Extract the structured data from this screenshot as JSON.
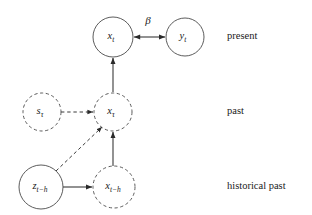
{
  "figure": {
    "type": "causal-graph-diagram",
    "background_color": "#ffffff",
    "line_color": "#3a3a3a",
    "node_stroke_color": "#4a4a4a",
    "text_color": "#1a1a1a"
  },
  "nodes": [
    {
      "id": "x_t",
      "label": "x",
      "subscript": "t",
      "style": "solid",
      "cx": 113,
      "cy": 37,
      "r": 20,
      "row": "present"
    },
    {
      "id": "y_t",
      "label": "y",
      "subscript": "t",
      "style": "solid",
      "cx": 185,
      "cy": 37,
      "r": 19,
      "row": "present"
    },
    {
      "id": "s_tau",
      "label": "s",
      "subscript": "τ",
      "style": "dashed",
      "cx": 42,
      "cy": 112,
      "r": 19,
      "row": "past"
    },
    {
      "id": "x_tau",
      "label": "x",
      "subscript": "τ",
      "style": "dashed",
      "cx": 113,
      "cy": 112,
      "r": 19,
      "row": "past"
    },
    {
      "id": "z_t_minus_h",
      "label": "z",
      "subscript": "t−h",
      "style": "solid",
      "cx": 41,
      "cy": 187,
      "r": 22,
      "row": "historical past"
    },
    {
      "id": "x_t_minus_h",
      "label": "x",
      "subscript": "t−h",
      "style": "dashed",
      "cx": 114,
      "cy": 187,
      "r": 21,
      "row": "historical past"
    }
  ],
  "edges": [
    {
      "id": "edge-x_t-y_t",
      "from": "x_t",
      "to": "y_t",
      "style": "solid",
      "arrow": "double",
      "label": "β",
      "label_x": 148,
      "label_y": 20
    },
    {
      "id": "edge-x_tau-x_t",
      "from": "x_tau",
      "to": "x_t",
      "style": "solid",
      "arrow": "single",
      "label": ""
    },
    {
      "id": "edge-s_tau-x_tau",
      "from": "s_tau",
      "to": "x_tau",
      "style": "dashed",
      "arrow": "single",
      "label": ""
    },
    {
      "id": "edge-x_t_minus_h-x_tau",
      "from": "x_t_minus_h",
      "to": "x_tau",
      "style": "solid",
      "arrow": "single",
      "label": ""
    },
    {
      "id": "edge-z_t_minus_h-x_tau",
      "from": "z_t_minus_h",
      "to": "x_tau",
      "style": "dashed",
      "arrow": "single",
      "label": ""
    },
    {
      "id": "edge-z_t_minus_h-x_t_minus_h",
      "from": "z_t_minus_h",
      "to": "x_t_minus_h",
      "style": "solid",
      "arrow": "single",
      "label": ""
    }
  ],
  "row_labels": [
    {
      "id": "row-present",
      "text": "present",
      "x": 227,
      "y": 37
    },
    {
      "id": "row-past",
      "text": "past",
      "x": 227,
      "y": 112
    },
    {
      "id": "row-historical-past",
      "text": "historical past",
      "x": 227,
      "y": 187
    }
  ]
}
